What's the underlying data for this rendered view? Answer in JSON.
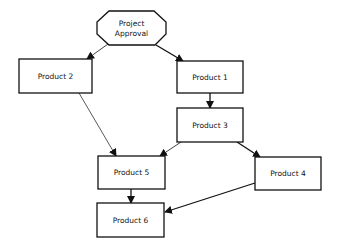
{
  "diagram": {
    "type": "flowchart",
    "colors": {
      "stroke": "#111111",
      "fill": "#ffffff",
      "text": "#111111"
    },
    "nodes": [
      {
        "id": "approval",
        "shape": "octagon",
        "label_line1": "Project",
        "label_line2": "Approval"
      },
      {
        "id": "p1",
        "shape": "rect",
        "label": "Product 1"
      },
      {
        "id": "p2",
        "shape": "rect",
        "label": "Product 2"
      },
      {
        "id": "p3",
        "shape": "rect",
        "label": "Product 3"
      },
      {
        "id": "p4",
        "shape": "rect",
        "label": "Product 4"
      },
      {
        "id": "p5",
        "shape": "rect",
        "label": "Product 5"
      },
      {
        "id": "p6",
        "shape": "rect",
        "label": "Product 6"
      }
    ],
    "edges": [
      {
        "from": "Project Approval",
        "to": "Product 2"
      },
      {
        "from": "Project Approval",
        "to": "Product 1"
      },
      {
        "from": "Product 1",
        "to": "Product 3"
      },
      {
        "from": "Product 2",
        "to": "Product 5"
      },
      {
        "from": "Product 3",
        "to": "Product 5"
      },
      {
        "from": "Product 3",
        "to": "Product 4"
      },
      {
        "from": "Product 5",
        "to": "Product 6"
      },
      {
        "from": "Product 4",
        "to": "Product 6"
      }
    ]
  }
}
